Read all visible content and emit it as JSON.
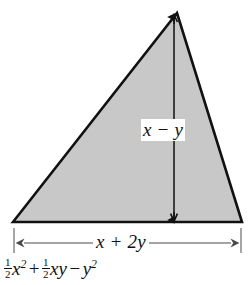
{
  "figure": {
    "shape": {
      "name": "triangle",
      "fill_color": "#c8c8c8",
      "stroke_color": "#111111",
      "vertices": [
        {
          "x": 13,
          "y": 222
        },
        {
          "x": 177,
          "y": 13
        },
        {
          "x": 242,
          "y": 222
        }
      ]
    },
    "height_dimension": {
      "label": "x − y",
      "label_plain": "x - y",
      "arrow_x": 174,
      "arrow_top_y": 16,
      "arrow_bottom_y": 221,
      "color": "#111111"
    },
    "base_dimension": {
      "label": "x + 2y",
      "arrow_y": 243,
      "arrow_left_x": 14,
      "arrow_right_x": 241,
      "tick_top_y": 228,
      "tick_bottom_y": 252,
      "color": "#555555"
    },
    "area_formula": {
      "terms": [
        {
          "fraction_numerator": "1",
          "fraction_denominator": "2",
          "variable": "x",
          "exponent": "2"
        },
        {
          "operator": "+",
          "fraction_numerator": "1",
          "fraction_denominator": "2",
          "variable": "xy",
          "exponent": ""
        },
        {
          "operator": "−",
          "variable": "y",
          "exponent": "2"
        }
      ],
      "plain_text": "1/2 x^2 + 1/2 xy - y^2",
      "first_num": "1",
      "first_den": "2",
      "first_var": "x",
      "first_exp": "2",
      "op1": "+",
      "second_num": "1",
      "second_den": "2",
      "second_var": "xy",
      "op2": "−",
      "third_var": "y",
      "third_exp": "2"
    }
  }
}
